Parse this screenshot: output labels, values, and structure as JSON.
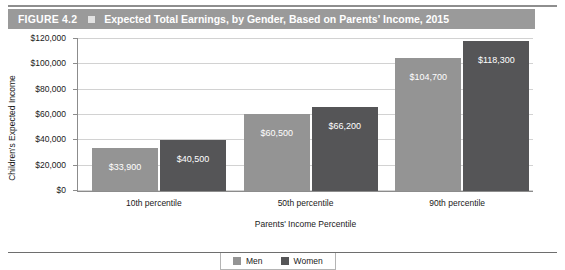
{
  "header": {
    "figure_number": "FIGURE 4.2",
    "marker_icon": "square-icon",
    "title": "Expected Total Earnings, by Gender, Based on Parents' Income, 2015"
  },
  "chart_data": {
    "type": "bar",
    "title": "Expected Total Earnings, by Gender, Based on Parents' Income, 2015",
    "xlabel": "Parents' Income Percentile",
    "ylabel": "Children's Expected Income",
    "categories": [
      "10th percentile",
      "50th percentile",
      "90th percentile"
    ],
    "series": [
      {
        "name": "Men",
        "color": "#949494",
        "values": [
          33900,
          60500,
          104700
        ],
        "labels": [
          "$33,900",
          "$60,500",
          "$104,700"
        ]
      },
      {
        "name": "Women",
        "color": "#555557",
        "values": [
          40500,
          66200,
          118300
        ],
        "labels": [
          "$40,500",
          "$66,200",
          "$118,300"
        ]
      }
    ],
    "ylim": [
      0,
      120000
    ],
    "ytick_values": [
      0,
      20000,
      40000,
      60000,
      80000,
      100000,
      120000
    ],
    "ytick_labels": [
      "$0",
      "$20,000",
      "$40,000",
      "$60,000",
      "$80,000",
      "$100,000",
      "$120,000"
    ],
    "grid": true,
    "legend_position": "bottom"
  },
  "legend": {
    "items": [
      {
        "label": "Men",
        "swatch": "men-swatch-icon"
      },
      {
        "label": "Women",
        "swatch": "women-swatch-icon"
      }
    ]
  }
}
